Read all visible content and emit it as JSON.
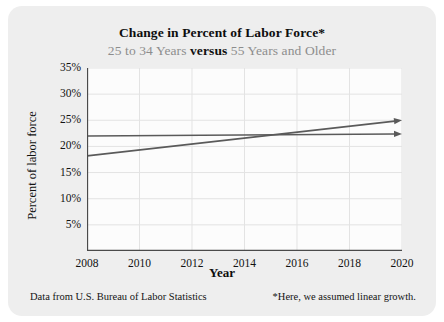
{
  "chart_data": {
    "type": "line",
    "title": "Change in Percent of Labor Force*",
    "subtitle_parts": {
      "left": "25 to 34 Years",
      "middle": "versus",
      "right": "55 Years and Older"
    },
    "xlabel": "Year",
    "ylabel": "Percent of labor force",
    "xlim": [
      2008,
      2020
    ],
    "ylim": [
      0,
      35
    ],
    "xticks": [
      2008,
      2010,
      2012,
      2014,
      2016,
      2018,
      2020
    ],
    "yticks": [
      "5%",
      "10%",
      "15%",
      "20%",
      "25%",
      "30%",
      "35%"
    ],
    "ytick_values": [
      5,
      10,
      15,
      20,
      25,
      30,
      35
    ],
    "grid": true,
    "legend": "none",
    "series": [
      {
        "name": "25 to 34 Years",
        "color": "#5a5a5a",
        "arrow": true,
        "x": [
          2008,
          2020
        ],
        "values": [
          22.0,
          22.4
        ]
      },
      {
        "name": "55 Years and Older",
        "color": "#5a5a5a",
        "arrow": true,
        "x": [
          2008,
          2020
        ],
        "values": [
          18.2,
          25.0
        ]
      }
    ]
  },
  "footer": {
    "source": "Data from U.S. Bureau of Labor Statistics",
    "note": "*Here, we assumed linear growth."
  },
  "colors": {
    "card": "#eeeeee",
    "plot_bg": "#fcfcfc",
    "line": "#5a5a5a",
    "grid": "#e3e3e3",
    "axis": "#4a4a4a",
    "subtitle": "#8d8d8d"
  }
}
